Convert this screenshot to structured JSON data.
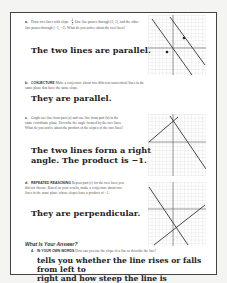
{
  "parts": [
    {
      "label": "a.",
      "text_pre": "Draw two lines with slope",
      "slope_sign": "−",
      "slope_num": "4",
      "slope_den": "3",
      "text_post": ". One line passes through (2, 1), and the other line passes through (−1, −1). What do you notice about the two lines?",
      "answer": "The two lines are parallel."
    },
    {
      "label": "b.",
      "keyword": "CONJECTURE",
      "text": "Make a conjecture about two different nonvertical lines in the same plane that have the same slope.",
      "answer": "They are parallel."
    },
    {
      "label": "c.",
      "text": "Graph one line from part (a) and one line from part (b) in the same coordinate plane. Describe the angle formed by the two lines. What do you notice about the product of the slopes of the two lines?",
      "answer_line1": "The two lines form a right",
      "answer_line2": "angle. The product is −1."
    },
    {
      "label": "d.",
      "keyword": "REPEATED REASONING",
      "text": "Repeat part (c) for the two lines you did not choose. Based on your results, make a conjecture about two lines in the same plane whose slopes have a product of −1.",
      "answer": "They are perpendicular."
    }
  ],
  "section_heading": "What Is Your Answer?",
  "question4": {
    "label": "4.",
    "keyword": "IN YOUR OWN WORDS",
    "text": "How can you use the slope of a line to describe the line?",
    "answer_line1": "tells you whether the line rises or falls from left to",
    "answer_line2": "right and how steep the line is"
  },
  "graphs": [
    {
      "name": "parallel-lines-graph",
      "axis_labels": {
        "x": "x",
        "y": "y"
      }
    },
    {
      "name": "right-angle-graph-c",
      "axis_labels": {
        "x": "x",
        "y": "y"
      }
    },
    {
      "name": "perpendicular-graph-d",
      "axis_labels": {
        "x": "x",
        "y": "y"
      }
    }
  ]
}
